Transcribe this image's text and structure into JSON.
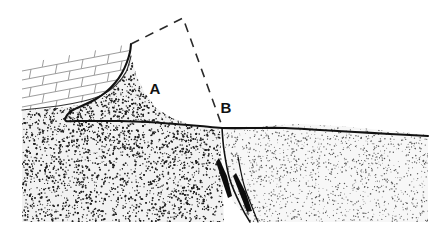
{
  "figure": {
    "background_color": "#ffffff",
    "ink_color": "#1a1a1a",
    "width": 438,
    "height": 237
  },
  "labels": [
    {
      "id": "A",
      "text": "A",
      "x": 155,
      "y": 94,
      "description": "upper break in slope at top of eroded scarp"
    },
    {
      "id": "B",
      "text": "B",
      "x": 226,
      "y": 113,
      "description": "lower break in slope where dashed projection meets ground surface"
    }
  ],
  "annotations": {
    "dashed_projection": {
      "name": "pre-erosion-profile",
      "style": "dashed",
      "dash_pattern": "9 7",
      "stroke_width": 1.6,
      "color": "#2a2a2a",
      "points": "131,44 183,18 222,126",
      "description": "dashed lines reconstructing the original pre-erosion land surface and cliff face"
    }
  },
  "units": [
    {
      "id": "bedded-unit",
      "name": "bedded-rock-unit",
      "pattern": "brick",
      "fill": "#ffffff",
      "stroke": "#2a2a2a",
      "description": "layered / bedded rock drawn with brick ornament, upper left",
      "outline": "22,64 130,44 130,46 128,58 120,76 108,90 96,98 78,104 55,108 22,110"
    },
    {
      "id": "dense-stipple-unit",
      "name": "dense-stipple-unit",
      "pattern": "coarse-stipple",
      "fill": "#f2f2f2",
      "stroke": "#1a1a1a",
      "description": "densely stippled poorly sorted deposit forming the main hillslope body, left of fault",
      "outline": "22,110 60,108 85,104 102,98 116,86 127,70 131,56 136,74 144,92 156,108 172,118 190,124 206,128 220,130 224,222 22,222"
    },
    {
      "id": "light-stipple-unit",
      "name": "light-stipple-unit",
      "pattern": "fine-stipple",
      "fill": "#f7f7f7",
      "stroke": "#1a1a1a",
      "description": "finely stippled valley-fill deposit on the downthrown side, right of fault",
      "outline": "224,128 260,126 300,124 340,126 380,130 410,133 428,135 428,222 250,222 232,200 226,160"
    }
  ],
  "surfaces": [
    {
      "id": "ground-surface",
      "name": "ground-surface-line",
      "stroke_width": 2.1,
      "color": "#111111",
      "description": "heavy continuous line tracing the present-day ground surface from the scarp crest down across the valley floor",
      "path": "131,44 130,52 127,62 122,73 115,83 106,92 96,99 86,104 77,108 70,112 66,117 66,121 76,121 96,121 120,121 148,122 175,124 200,126 222,128 250,128 285,128 320,130 355,132 390,134 428,136"
    },
    {
      "id": "bedded-base",
      "name": "bedded-unit-base-contact",
      "stroke_width": 1.2,
      "color": "#333333",
      "description": "contact between bedded unit above and stippled unit below",
      "path": "22,110 58,106 84,101 102,95 116,85 126,72 131,56"
    }
  ],
  "structures": [
    {
      "id": "fault-main",
      "name": "main-fault-plane",
      "type": "normal-fault",
      "color": "#111111",
      "stroke_width": 1.6,
      "description": "steeply dipping fault separating dense stipple unit from light stipple unit",
      "path": "222,128 224,150 230,180 242,208 250,222"
    },
    {
      "id": "fault-splay",
      "name": "fault-splay-line",
      "type": "splay",
      "color": "#111111",
      "stroke_width": 1.2,
      "description": "secondary splay line parallel to the main fault",
      "path": "238,157 244,185 254,212 258,222"
    },
    {
      "id": "wedge-left",
      "name": "dark-fault-wedge-left",
      "type": "filled-wedge",
      "color": "#0d0d0d",
      "description": "solid black elongate sliver along the fault, left strand",
      "outline": "219,158 227,176 232,196 228,198 222,180 216,162"
    },
    {
      "id": "wedge-right",
      "name": "dark-fault-wedge-right",
      "type": "filled-wedge",
      "color": "#0d0d0d",
      "description": "solid black elongate sliver along the fault, right strand",
      "outline": "236,173 246,193 252,211 247,212 240,194 233,176"
    }
  ],
  "ornament": {
    "brick_rows": [
      {
        "y_offset": 0,
        "stagger": 0
      },
      {
        "y_offset": 9,
        "stagger": 14
      },
      {
        "y_offset": 18,
        "stagger": 0
      },
      {
        "y_offset": 27,
        "stagger": 14
      },
      {
        "y_offset": 36,
        "stagger": 0
      },
      {
        "y_offset": 45,
        "stagger": 14
      }
    ],
    "brick_color": "#8a8a8a",
    "dense_stipple_dot_count": 5200,
    "light_stipple_dot_count": 1500,
    "dense_stipple_color": "#1f1f1f",
    "light_stipple_color": "#555555"
  }
}
